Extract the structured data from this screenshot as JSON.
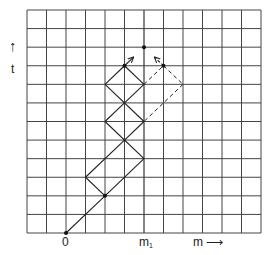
{
  "diagram": {
    "type": "lattice-path-diagram",
    "grid": {
      "columns": 12,
      "rows": 12,
      "left": 27,
      "top": 10,
      "right": 261,
      "bottom": 233,
      "line_color": "#444444"
    },
    "axes": {
      "vertical_label": "t",
      "vertical_arrow": "↑",
      "horizontal_label": "m",
      "horizontal_arrow": "⟶",
      "origin_label": "0",
      "marker_label": "m",
      "marker_subscript": "1"
    },
    "origin": [
      2,
      0
    ],
    "marker_column": 6,
    "solid_segments": [
      [
        [
          2,
          0
        ],
        [
          4,
          2
        ]
      ],
      [
        [
          4,
          2
        ],
        [
          3,
          3
        ]
      ],
      [
        [
          3,
          3
        ],
        [
          5,
          5
        ]
      ],
      [
        [
          4,
          2
        ],
        [
          6,
          4
        ]
      ],
      [
        [
          6,
          4
        ],
        [
          4,
          6
        ]
      ],
      [
        [
          5,
          5
        ],
        [
          6,
          6
        ]
      ],
      [
        [
          4,
          6
        ],
        [
          5,
          7
        ]
      ],
      [
        [
          6,
          6
        ],
        [
          4,
          8
        ]
      ],
      [
        [
          5,
          7
        ],
        [
          6,
          8
        ]
      ],
      [
        [
          4,
          8
        ],
        [
          5,
          9
        ]
      ],
      [
        [
          6,
          8
        ],
        [
          5,
          9
        ]
      ]
    ],
    "dashed_segments": [
      [
        [
          6,
          8
        ],
        [
          7,
          9
        ]
      ],
      [
        [
          7,
          9
        ],
        [
          8,
          8
        ]
      ],
      [
        [
          8,
          8
        ],
        [
          6,
          6
        ]
      ]
    ],
    "arrows": [
      {
        "from": [
          5,
          9
        ],
        "to": [
          5.45,
          9.45
        ],
        "style": "solid"
      },
      {
        "from": [
          7,
          9
        ],
        "to": [
          6.55,
          9.45
        ],
        "style": "dashed"
      }
    ],
    "dots": [
      [
        2,
        0
      ],
      [
        4,
        2
      ],
      [
        5,
        9
      ],
      [
        6,
        10
      ],
      [
        7,
        9
      ]
    ]
  }
}
